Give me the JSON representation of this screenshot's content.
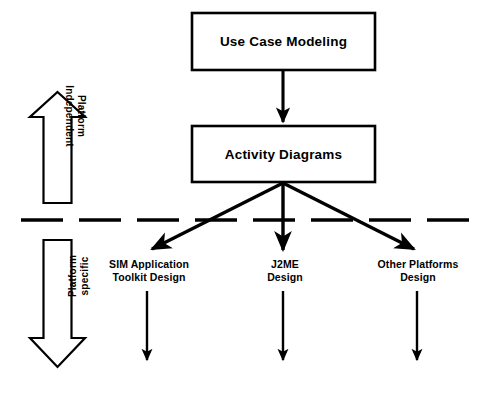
{
  "diagram": {
    "title_boxes": [
      {
        "id": "use-case",
        "label": "Use Case Modeling"
      },
      {
        "id": "activity",
        "label": "Activity Diagrams"
      }
    ],
    "bands": [
      {
        "id": "independent",
        "line1": "Platform",
        "line2": "Independent",
        "arrow_direction": "up"
      },
      {
        "id": "specific",
        "line1": "Platform",
        "line2": "specific",
        "arrow_direction": "down"
      }
    ],
    "leaves": [
      {
        "id": "sim",
        "line1": "SIM Application",
        "line2": "Toolkit Design"
      },
      {
        "id": "j2me",
        "line1": "J2ME",
        "line2": "Design"
      },
      {
        "id": "other",
        "line1": "Other Platforms",
        "line2": "Design"
      }
    ],
    "divider": {
      "style": "dashed",
      "dash_count": 8
    },
    "colors": {
      "stroke": "#000000",
      "fill": "#ffffff",
      "background": "#ffffff"
    }
  }
}
